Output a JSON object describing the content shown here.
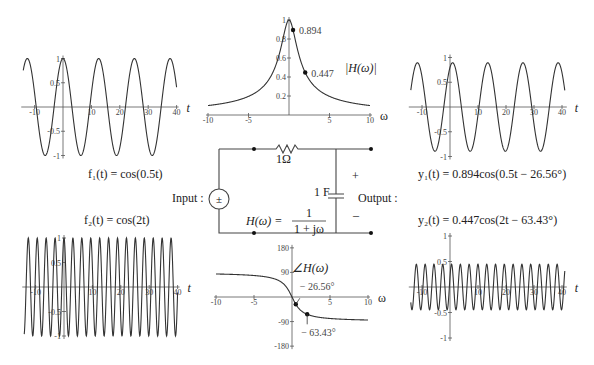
{
  "labels": {
    "f1": "f₁(t) = cos(0.5t)",
    "f2": "f₂(t) = cos(2t)",
    "y1": "y₁(t) = 0.894cos(0.5t − 26.56°)",
    "y2": "y₂(t) = 0.447cos(2t − 63.43°)",
    "input": "Input :",
    "output": "Output :",
    "resistor": "1Ω",
    "capacitor": "1 F",
    "plus": "+",
    "minus": "–",
    "source_symbol": "±",
    "transfer_lhs": "H(ω) =",
    "transfer_num": "1",
    "transfer_den": "1 + jω",
    "mag_title": "|H(ω)|",
    "phase_title": "∠H(ω)",
    "t_axis": "t",
    "w_axis": "ω"
  },
  "chart_data": [
    {
      "id": "f1",
      "type": "line",
      "title": "f1(t) = cos(0.5t)",
      "xlabel": "t",
      "ylabel": "",
      "amplitude": 1,
      "omega": 0.5,
      "phase_deg": 0,
      "xlim": [
        -14,
        40
      ],
      "ylim": [
        -1,
        1
      ],
      "xticks": [
        -10,
        10,
        20,
        30,
        40
      ],
      "yticks": [
        1,
        0.5,
        -0.5,
        -1
      ],
      "box": {
        "x0": 63,
        "y0": 107,
        "px_per_x": 2.84,
        "px_per_y": 48.5
      }
    },
    {
      "id": "f2",
      "type": "line",
      "title": "f2(t) = cos(2t)",
      "xlabel": "t",
      "ylabel": "",
      "amplitude": 1,
      "omega": 2,
      "phase_deg": 0,
      "xlim": [
        -14,
        40
      ],
      "ylim": [
        -1,
        1
      ],
      "xticks": [
        -10,
        10,
        20,
        30,
        40
      ],
      "yticks": [
        1,
        0.5,
        -0.5,
        -1
      ],
      "box": {
        "x0": 64,
        "y0": 287,
        "px_per_x": 2.84,
        "px_per_y": 49
      }
    },
    {
      "id": "y1",
      "type": "line",
      "title": "y1(t) = 0.894cos(0.5t − 26.56°)",
      "xlabel": "t",
      "ylabel": "",
      "amplitude": 0.894,
      "omega": 0.5,
      "phase_deg": -26.56,
      "xlim": [
        -14,
        41
      ],
      "ylim": [
        -1,
        1
      ],
      "xticks": [
        -10,
        10,
        20,
        30,
        40
      ],
      "yticks": [
        1,
        0.5,
        -0.5,
        -1
      ],
      "box": {
        "x0": 450,
        "y0": 107,
        "px_per_x": 2.8,
        "px_per_y": 49.5
      }
    },
    {
      "id": "y2",
      "type": "line",
      "title": "y2(t) = 0.447cos(2t − 63.43°)",
      "xlabel": "t",
      "ylabel": "",
      "amplitude": 0.447,
      "omega": 2,
      "phase_deg": -63.43,
      "xlim": [
        -14,
        41
      ],
      "ylim": [
        -1,
        1
      ],
      "xticks": [
        -10,
        10,
        20,
        30,
        40
      ],
      "yticks": [
        1,
        0.5,
        -0.5,
        -1
      ],
      "box": {
        "x0": 450,
        "y0": 287,
        "px_per_x": 2.8,
        "px_per_y": 51
      }
    },
    {
      "id": "mag",
      "type": "line",
      "title": "|H(ω)|",
      "xlabel": "ω",
      "ylabel": "",
      "function": "1/sqrt(1+w^2)",
      "xlim": [
        -10,
        10
      ],
      "ylim": [
        0,
        1
      ],
      "xticks": [
        -10,
        -5,
        5,
        10
      ],
      "yticks": [
        0.2,
        0.4,
        0.6,
        0.8,
        1
      ],
      "points": [
        {
          "x": 0.5,
          "y": 0.894,
          "label": "0.894"
        },
        {
          "x": 2,
          "y": 0.447,
          "label": "0.447"
        }
      ],
      "box": {
        "x0": 289,
        "y0": 115,
        "px_per_x": 8.1,
        "px_per_y": 95
      }
    },
    {
      "id": "phase",
      "type": "line",
      "title": "∠H(ω)",
      "xlabel": "ω",
      "ylabel": "",
      "function": "-atan(w) in degrees",
      "xlim": [
        -10,
        10
      ],
      "ylim": [
        -180,
        180
      ],
      "xticks": [
        -10,
        -5,
        5,
        10
      ],
      "yticks": [
        180,
        90,
        -90,
        -180
      ],
      "points": [
        {
          "x": 0.5,
          "y": -26.56,
          "label": "− 26.56°"
        },
        {
          "x": 2,
          "y": -63.43,
          "label": "− 63.43°"
        }
      ],
      "box": {
        "x0": 292,
        "y0": 297,
        "px_per_x": 7.6,
        "px_per_y": 0.273
      }
    }
  ]
}
